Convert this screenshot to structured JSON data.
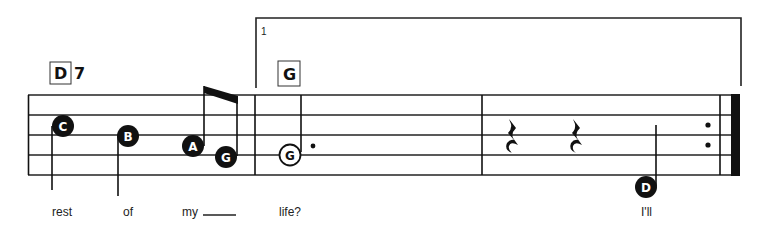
{
  "colors": {
    "ink": "#111111",
    "paper": "#ffffff"
  },
  "chords": [
    {
      "root": "D",
      "quality": "7"
    },
    {
      "root": "G",
      "quality": ""
    }
  ],
  "ending": {
    "number": "1"
  },
  "notes": [
    {
      "letter": "C",
      "style": "filled",
      "duration": "quarter"
    },
    {
      "letter": "B",
      "style": "filled",
      "duration": "quarter"
    },
    {
      "letter": "A",
      "style": "filled",
      "duration": "eighth"
    },
    {
      "letter": "G",
      "style": "filled",
      "duration": "eighth"
    },
    {
      "letter": "G",
      "style": "open",
      "duration": "dotted-half"
    },
    {
      "letter": "D",
      "style": "filled",
      "duration": "quarter"
    }
  ],
  "rests": [
    {
      "type": "quarter-rest"
    },
    {
      "type": "quarter-rest"
    }
  ],
  "lyrics": [
    {
      "text": "rest"
    },
    {
      "text": "of"
    },
    {
      "text": "my"
    },
    {
      "text": "life?"
    },
    {
      "text": "I'll"
    }
  ]
}
